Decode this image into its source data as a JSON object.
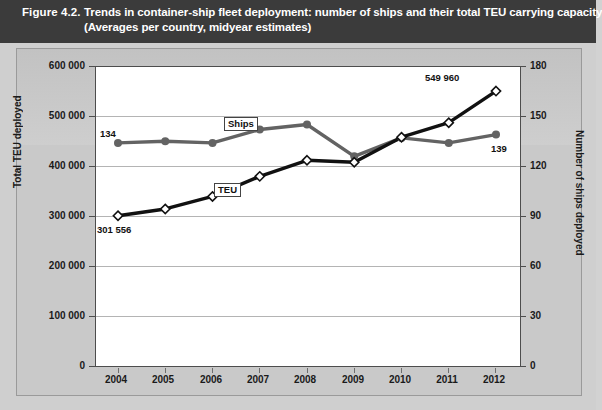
{
  "header": {
    "figure_number": "Figure 4.2.",
    "title_line1": "Trends in container-ship fleet deployment: number of ships and their total TEU carrying capacity",
    "title_line2": "(Averages per country, midyear estimates)"
  },
  "axes": {
    "left_title": "Total TEU deployed",
    "right_title": "Number of ships deployed",
    "left_ticks": [
      "600 000",
      "500 000",
      "400 000",
      "300 000",
      "200 000",
      "100 000",
      "0"
    ],
    "right_ticks": [
      "180",
      "150",
      "120",
      "90",
      "60",
      "30",
      "0"
    ],
    "x_ticks": [
      "2004",
      "2005",
      "2006",
      "2007",
      "2008",
      "2009",
      "2010",
      "2011",
      "2012"
    ]
  },
  "annotations": {
    "ships_label": "Ships",
    "teu_label": "TEU",
    "ships_first_value": "134",
    "ships_last_value": "139",
    "teu_first_value": "301 556",
    "teu_last_value": "549 960"
  },
  "colors": {
    "header_bg": "#3b3b3b",
    "header_text": "#ffffff",
    "figure_bg": "#c9c9c9",
    "plot_bg": "#ffffff",
    "gridline": "#b4b4b4",
    "axis": "#4d4d4d",
    "teu_series": "#111111",
    "ships_series": "#636363"
  },
  "chart_data": {
    "type": "line",
    "title": "Trends in container-ship fleet deployment: number of ships and their total TEU carrying capacity",
    "subtitle": "(Averages per country, midyear estimates)",
    "xlabel": "",
    "ylabel": "Total TEU deployed",
    "y2label": "Number of ships deployed",
    "x": [
      "2004",
      "2005",
      "2006",
      "2007",
      "2008",
      "2009",
      "2010",
      "2011",
      "2012"
    ],
    "ylim": [
      0,
      600000
    ],
    "y2lim": [
      0,
      180
    ],
    "yticks": [
      0,
      100000,
      200000,
      300000,
      400000,
      500000,
      600000
    ],
    "y2ticks": [
      0,
      30,
      60,
      90,
      120,
      150,
      180
    ],
    "grid": true,
    "legend": "inline-labels",
    "series": [
      {
        "name": "TEU",
        "axis": "left",
        "marker": "diamond-open",
        "color": "#111111",
        "values": [
          301556,
          315000,
          340000,
          380000,
          412000,
          408000,
          458000,
          487000,
          549960
        ],
        "labels": {
          "2004": "301 556",
          "2012": "549 960"
        }
      },
      {
        "name": "Ships",
        "axis": "right",
        "marker": "circle-filled",
        "color": "#636363",
        "values": [
          134,
          135,
          134,
          142,
          145,
          126,
          137,
          134,
          139
        ],
        "labels": {
          "2004": "134",
          "2012": "139"
        }
      }
    ]
  }
}
